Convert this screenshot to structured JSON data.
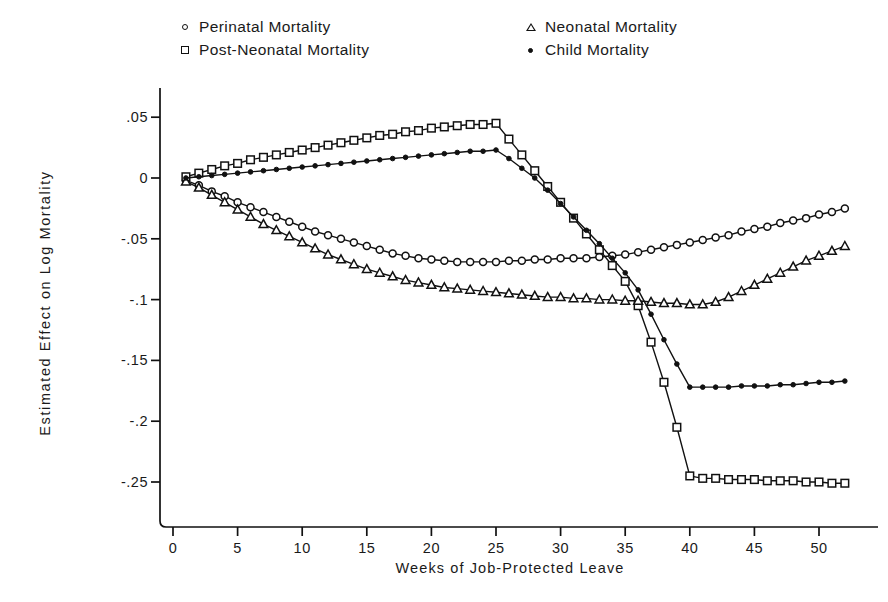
{
  "chart_data": {
    "type": "line",
    "title": "",
    "xlabel": "Weeks of Job-Protected Leave",
    "ylabel": "Estimated Effect on Log Mortality",
    "xlim": [
      0,
      53.5
    ],
    "ylim": [
      -0.262,
      0.058
    ],
    "xticks": [
      0,
      5,
      10,
      15,
      20,
      25,
      30,
      35,
      40,
      45,
      50
    ],
    "yticks": [
      0.05,
      0,
      -0.05,
      -0.1,
      -0.15,
      -0.2,
      -0.25
    ],
    "ytick_labels": [
      ".05",
      "0",
      "-.05",
      "-.1",
      "-.15",
      "-.2",
      "-.25"
    ],
    "xtick_labels": [
      "0",
      "5",
      "10",
      "15",
      "20",
      "25",
      "30",
      "35",
      "40",
      "45",
      "50"
    ],
    "grid": false,
    "legend_position": "above-plot",
    "x": [
      1,
      2,
      3,
      4,
      5,
      6,
      7,
      8,
      9,
      10,
      11,
      12,
      13,
      14,
      15,
      16,
      17,
      18,
      19,
      20,
      21,
      22,
      23,
      24,
      25,
      26,
      27,
      28,
      29,
      30,
      31,
      32,
      33,
      34,
      35,
      36,
      37,
      38,
      39,
      40,
      41,
      42,
      43,
      44,
      45,
      46,
      47,
      48,
      49,
      50,
      51,
      52
    ],
    "series": [
      {
        "name": "Perinatal Mortality",
        "marker": "circle-open",
        "values": [
          -0.002,
          -0.006,
          -0.011,
          -0.015,
          -0.02,
          -0.024,
          -0.028,
          -0.032,
          -0.036,
          -0.04,
          -0.044,
          -0.047,
          -0.05,
          -0.053,
          -0.056,
          -0.059,
          -0.062,
          -0.064,
          -0.066,
          -0.067,
          -0.068,
          -0.069,
          -0.069,
          -0.069,
          -0.069,
          -0.068,
          -0.068,
          -0.067,
          -0.067,
          -0.066,
          -0.066,
          -0.066,
          -0.065,
          -0.064,
          -0.063,
          -0.061,
          -0.059,
          -0.057,
          -0.055,
          -0.053,
          -0.051,
          -0.049,
          -0.047,
          -0.044,
          -0.042,
          -0.04,
          -0.037,
          -0.035,
          -0.033,
          -0.03,
          -0.028,
          -0.025
        ]
      },
      {
        "name": "Post-Neonatal Mortality",
        "marker": "square-open",
        "values": [
          0.001,
          0.004,
          0.007,
          0.01,
          0.012,
          0.015,
          0.017,
          0.019,
          0.021,
          0.023,
          0.025,
          0.027,
          0.029,
          0.031,
          0.033,
          0.035,
          0.036,
          0.038,
          0.039,
          0.041,
          0.042,
          0.043,
          0.044,
          0.044,
          0.045,
          0.032,
          0.019,
          0.006,
          -0.007,
          -0.02,
          -0.033,
          -0.046,
          -0.059,
          -0.072,
          -0.085,
          -0.105,
          -0.135,
          -0.168,
          -0.205,
          -0.245,
          -0.247,
          -0.247,
          -0.248,
          -0.248,
          -0.248,
          -0.249,
          -0.249,
          -0.249,
          -0.25,
          -0.25,
          -0.251,
          -0.251
        ]
      },
      {
        "name": "Neonatal Mortality",
        "marker": "triangle-open",
        "values": [
          -0.003,
          -0.008,
          -0.014,
          -0.02,
          -0.026,
          -0.032,
          -0.038,
          -0.043,
          -0.048,
          -0.053,
          -0.058,
          -0.063,
          -0.067,
          -0.071,
          -0.075,
          -0.078,
          -0.081,
          -0.084,
          -0.086,
          -0.088,
          -0.09,
          -0.091,
          -0.092,
          -0.093,
          -0.094,
          -0.095,
          -0.096,
          -0.097,
          -0.098,
          -0.098,
          -0.099,
          -0.099,
          -0.1,
          -0.1,
          -0.101,
          -0.101,
          -0.102,
          -0.103,
          -0.103,
          -0.104,
          -0.104,
          -0.102,
          -0.098,
          -0.093,
          -0.088,
          -0.083,
          -0.078,
          -0.073,
          -0.068,
          -0.064,
          -0.06,
          -0.056
        ]
      },
      {
        "name": "Child Mortality",
        "marker": "dot-filled",
        "values": [
          0.0,
          0.001,
          0.002,
          0.003,
          0.004,
          0.005,
          0.006,
          0.007,
          0.008,
          0.009,
          0.01,
          0.011,
          0.012,
          0.013,
          0.014,
          0.015,
          0.016,
          0.017,
          0.018,
          0.019,
          0.02,
          0.021,
          0.022,
          0.022,
          0.023,
          0.016,
          0.008,
          0.0,
          -0.01,
          -0.021,
          -0.032,
          -0.043,
          -0.054,
          -0.066,
          -0.078,
          -0.092,
          -0.112,
          -0.133,
          -0.153,
          -0.172,
          -0.172,
          -0.172,
          -0.172,
          -0.171,
          -0.171,
          -0.171,
          -0.17,
          -0.17,
          -0.169,
          -0.168,
          -0.168,
          -0.167
        ]
      }
    ]
  },
  "legend": {
    "entries": [
      {
        "label": "Perinatal Mortality",
        "marker": "circle-open"
      },
      {
        "label": "Post-Neonatal Mortality",
        "marker": "square-open"
      },
      {
        "label": "Neonatal Mortality",
        "marker": "triangle-open"
      },
      {
        "label": "Child Mortality",
        "marker": "dot-filled"
      }
    ]
  },
  "style": {
    "line_color": "#111111",
    "axis_color": "#1a1a1a",
    "background": "#ffffff"
  }
}
